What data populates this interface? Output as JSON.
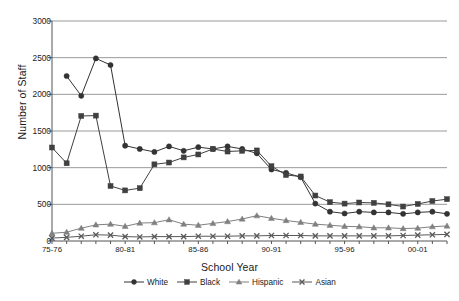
{
  "chart_data": {
    "type": "line",
    "title": "",
    "xlabel": "School Year",
    "ylabel": "Number of Staff",
    "ylim": [
      0,
      3000
    ],
    "ytick_values": [
      0,
      500,
      1000,
      1500,
      2000,
      2500,
      3000
    ],
    "ytick_labels": [
      "0",
      "500",
      "1000",
      "1500",
      "2000",
      "2500",
      "3000"
    ],
    "grid": true,
    "legend_position": "bottom",
    "categories": [
      "75-76",
      "76-77",
      "77-78",
      "78-79",
      "79-80",
      "80-81",
      "81-82",
      "82-83",
      "83-84",
      "84-85",
      "85-86",
      "86-87",
      "87-88",
      "88-89",
      "89-90",
      "90-91",
      "91-92",
      "92-93",
      "93-94",
      "94-95",
      "95-96",
      "96-97",
      "97-98",
      "98-99",
      "99-00",
      "00-01",
      "01-02",
      "02-03"
    ],
    "xtick_labels": [
      "75-76",
      "80-81",
      "85-86",
      "90-91",
      "95-96",
      "00-01"
    ],
    "xtick_categories": [
      "75-76",
      "80-81",
      "85-86",
      "90-91",
      "95-96",
      "00-01"
    ],
    "series": [
      {
        "name": "White",
        "marker": "circle",
        "color": "#333333",
        "values": [
          null,
          2250,
          1980,
          2490,
          2400,
          1300,
          1255,
          1215,
          1290,
          1230,
          1280,
          1255,
          1290,
          1255,
          1195,
          975,
          930,
          870,
          510,
          400,
          375,
          400,
          390,
          390,
          370,
          390,
          400,
          370
        ]
      },
      {
        "name": "Black",
        "marker": "square",
        "color": "#404040",
        "values": [
          1275,
          1060,
          1705,
          1710,
          750,
          690,
          720,
          1045,
          1070,
          1140,
          1180,
          1255,
          1220,
          1230,
          1235,
          1020,
          900,
          880,
          620,
          530,
          510,
          525,
          520,
          500,
          470,
          505,
          545,
          570
        ]
      },
      {
        "name": "Hispanic",
        "marker": "triangle",
        "color": "#808080",
        "values": [
          105,
          120,
          175,
          220,
          230,
          200,
          245,
          250,
          290,
          230,
          215,
          240,
          265,
          300,
          345,
          310,
          280,
          255,
          230,
          215,
          200,
          195,
          180,
          180,
          170,
          175,
          195,
          205
        ]
      },
      {
        "name": "Asian",
        "marker": "cross",
        "color": "#595959",
        "values": [
          40,
          50,
          65,
          85,
          80,
          60,
          55,
          60,
          60,
          60,
          65,
          65,
          65,
          70,
          70,
          75,
          75,
          75,
          70,
          70,
          70,
          70,
          70,
          70,
          75,
          80,
          85,
          90
        ]
      }
    ]
  },
  "legend": {
    "items": [
      {
        "label": "White"
      },
      {
        "label": "Black"
      },
      {
        "label": "Hispanic"
      },
      {
        "label": "Asian"
      }
    ]
  }
}
